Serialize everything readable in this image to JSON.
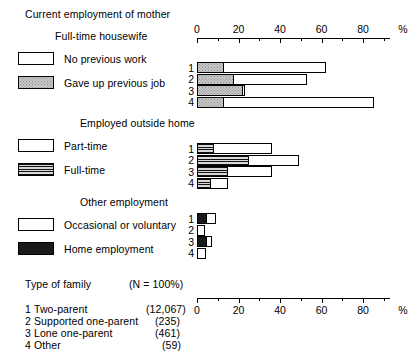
{
  "title": "Current employment of mother",
  "sections": [
    {
      "heading": "Full-time housewife",
      "legend": [
        {
          "label": "No previous work",
          "pattern": "white"
        },
        {
          "label": "Gave up previous job",
          "pattern": "dots"
        }
      ]
    },
    {
      "heading": "Employed outside home",
      "legend": [
        {
          "label": "Part-time",
          "pattern": "white"
        },
        {
          "label": "Full-time",
          "pattern": "hatch"
        }
      ]
    },
    {
      "heading": "Other employment",
      "legend": [
        {
          "label": "Occasional or voluntary",
          "pattern": "white"
        },
        {
          "label": "Home employment",
          "pattern": "black"
        }
      ]
    }
  ],
  "family_key": {
    "title": "Type of family",
    "n_note": "(N = 100%)",
    "rows": [
      {
        "num": "1",
        "label": "Two-parent",
        "n": "(12,067)"
      },
      {
        "num": "2",
        "label": "Supported one-parent",
        "n": "(235)"
      },
      {
        "num": "3",
        "label": "Lone one-parent",
        "n": "(461)"
      },
      {
        "num": "4",
        "label": "Other",
        "n": "(59)"
      }
    ]
  },
  "axis": {
    "ticks": [
      "0",
      "20",
      "40",
      "60",
      "80"
    ],
    "unit": "%",
    "min": 0,
    "max": 90
  },
  "row_numbers": [
    "1",
    "2",
    "3",
    "4"
  ],
  "chart_data": {
    "type": "bar",
    "title": "Current employment of mother",
    "orientation": "horizontal",
    "stacked": true,
    "xlabel": "%",
    "ylabel": "Type of family",
    "xlim": [
      0,
      90
    ],
    "grid": false,
    "legend_position": "left",
    "categories": [
      "1 Two-parent",
      "2 Supported one-parent",
      "3 Lone one-parent",
      "4 Other"
    ],
    "panels": [
      {
        "name": "Full-time housewife",
        "series": [
          {
            "name": "Gave up previous job",
            "pattern": "dots",
            "values": [
              12,
              17,
              21,
              12
            ]
          },
          {
            "name": "No previous work",
            "pattern": "white",
            "values": [
              49,
              35,
              1,
              72
            ]
          }
        ],
        "totals": [
          61,
          52,
          22,
          84
        ]
      },
      {
        "name": "Employed outside home",
        "series": [
          {
            "name": "Full-time",
            "pattern": "hatch",
            "values": [
              7,
              24,
              14,
              6
            ]
          },
          {
            "name": "Part-time",
            "pattern": "white",
            "values": [
              28,
              24,
              21,
              8
            ]
          }
        ],
        "totals": [
          35,
          48,
          35,
          14
        ]
      },
      {
        "name": "Other employment",
        "series": [
          {
            "name": "Home employment",
            "pattern": "black",
            "values": [
              4,
              0,
              4,
              0
            ]
          },
          {
            "name": "Occasional or voluntary",
            "pattern": "white",
            "values": [
              4,
              2.5,
              2,
              3
            ]
          }
        ],
        "totals": [
          8,
          2.5,
          6,
          3
        ]
      }
    ]
  }
}
